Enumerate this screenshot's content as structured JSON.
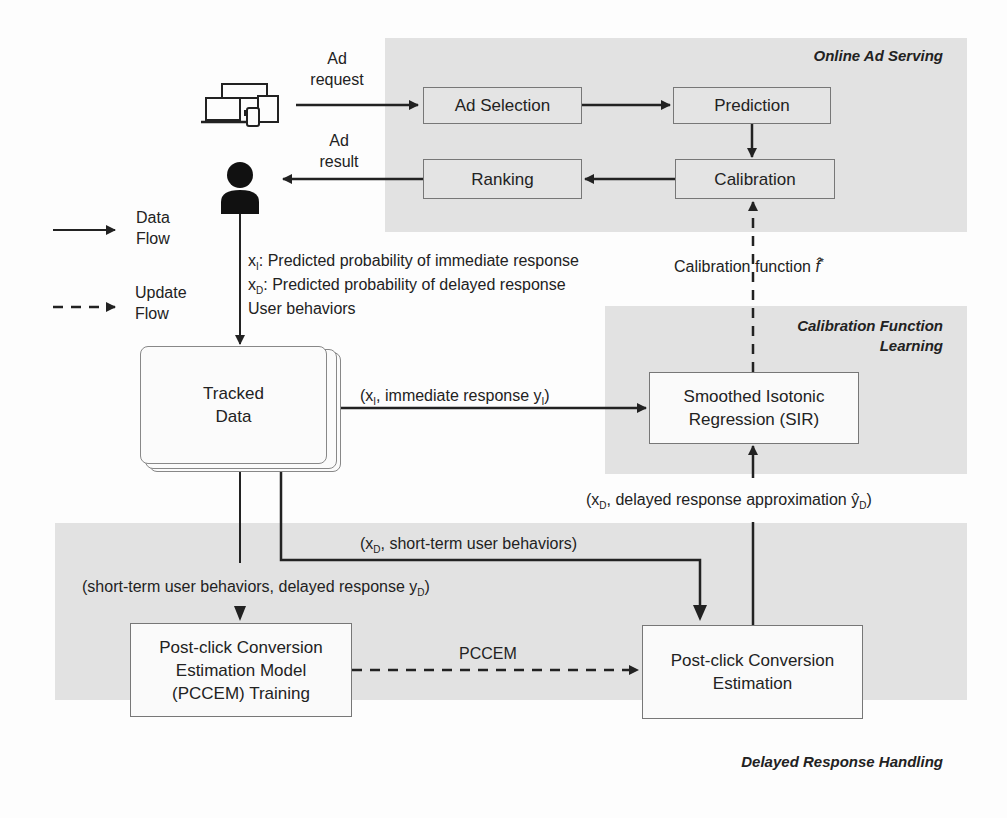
{
  "regions": {
    "online": {
      "title": "Online Ad Serving"
    },
    "calibration_learning": {
      "title_line1": "Calibration Function",
      "title_line2": "Learning"
    },
    "delayed": {
      "title": "Delayed Response Handling"
    }
  },
  "boxes": {
    "ad_selection": "Ad Selection",
    "prediction": "Prediction",
    "ranking": "Ranking",
    "calibration": "Calibration",
    "tracked_data_line1": "Tracked",
    "tracked_data_line2": "Data",
    "sir_line1": "Smoothed Isotonic",
    "sir_line2": "Regression (SIR)",
    "pccem_training_line1": "Post-click Conversion",
    "pccem_training_line2": "Estimation Model",
    "pccem_training_line3": "(PCCEM) Training",
    "pce_line1": "Post-click Conversion",
    "pce_line2": "Estimation"
  },
  "labels": {
    "ad_request_line1": "Ad",
    "ad_request_line2": "request",
    "ad_result_line1": "Ad",
    "ad_result_line2": "result",
    "xi_desc": "Predicted probability of immediate response",
    "xd_desc": "Predicted probability of delayed response",
    "user_behaviors": "User behaviors",
    "calibration_function": "Calibration function",
    "immediate_pair": "immediate response",
    "delayed_approx": "delayed response approximation",
    "short_term_pair": "short-term user behaviors",
    "short_term_delayed": "(short-term user behaviors, delayed response",
    "pccem": "PCCEM"
  },
  "legend": {
    "data_flow_line1": "Data",
    "data_flow_line2": "Flow",
    "update_flow_line1": "Update",
    "update_flow_line2": "Flow"
  },
  "icons": {
    "devices": "devices-icon",
    "user": "user-icon"
  },
  "colors": {
    "region_bg": "#e2e2e2",
    "line": "#222222",
    "box_border": "#777777"
  }
}
